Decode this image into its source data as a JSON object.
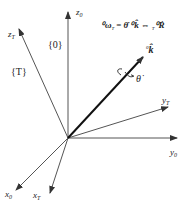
{
  "diagram": {
    "title_equation": {
      "lhs": "⁰ω",
      "lhs_sub": "T",
      "eq": "=",
      "rhs1": "θ̇ ⁰k̂",
      "arrow": "⇔",
      "rhs2_pre": "T",
      "rhs2": "⁰Ṙ"
    },
    "frames": {
      "world": "{0}",
      "tool": "{T}"
    },
    "axes": {
      "z0": "z",
      "z0_sub": "0",
      "y0": "y",
      "y0_sub": "0",
      "x0": "x",
      "x0_sub": "0",
      "zT": "z",
      "zT_sub": "T",
      "yT": "y",
      "yT_sub": "T",
      "xT": "x",
      "xT_sub": "T"
    },
    "rotation_axis": {
      "label_pre": "0",
      "label": "k̂",
      "angle": "θ̇"
    }
  }
}
